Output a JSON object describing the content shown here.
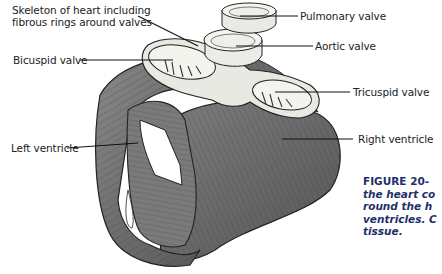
{
  "figure": {
    "labels": {
      "skeleton": [
        "Skeleton of heart including",
        "fibrous rings around valves"
      ],
      "bicuspid": "Bicuspid valve",
      "left_ventricle": "Left ventricle",
      "pulmonary": "Pulmonary valve",
      "aortic": "Aortic valve",
      "tricuspid": "Tricuspid valve",
      "right_ventricle": "Right ventricle"
    },
    "caption": {
      "number": "FIGURE 20-",
      "lines": [
        "the heart co",
        "round the h",
        "ventricles. C",
        "tissue."
      ]
    },
    "artist_signature": "signature"
  }
}
